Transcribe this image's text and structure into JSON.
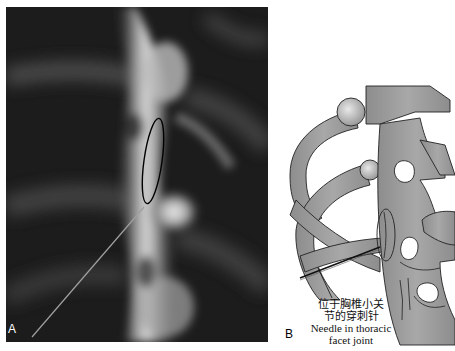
{
  "figure": {
    "panels": [
      {
        "id": "A",
        "label": "A",
        "type": "fluoroscopic X-ray image",
        "description": "Thoracic spine fluoroscopy with needle directed to facet joint; facet joint circled with black ellipse"
      },
      {
        "id": "B",
        "label": "B",
        "type": "anatomical illustration",
        "description": "Illustration of thoracic vertebrae and ribs with needle placed in facet joint"
      }
    ],
    "annotation": {
      "zh_line1": "位于胸椎小关",
      "zh_line2": "节的穿刺针",
      "en_line1": "Needle in thoracic",
      "en_line2": "facet joint"
    },
    "colors": {
      "xray_background": "#1a1a1a",
      "bone_fill": "#9a9a9a",
      "outline": "#222222",
      "ellipse_marker": "#000000"
    }
  }
}
